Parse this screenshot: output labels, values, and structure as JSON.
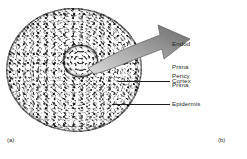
{
  "figure": {
    "panels": [
      {
        "id": "a",
        "caption": "(a)",
        "type": "light-micrograph",
        "subject": "root cross section",
        "callouts": [
          {
            "label": "Cortex",
            "line_y": 81,
            "line_x1": 118,
            "line_x2": 170,
            "text_x": 172,
            "text_y": 78
          },
          {
            "label": "Epidermis",
            "line_y": 104,
            "line_x1": 112,
            "line_x2": 170,
            "text_x": 172,
            "text_y": 101
          }
        ]
      },
      {
        "id": "b",
        "caption": "(b)",
        "type": "labeled-diagram",
        "labels": [
          {
            "text": "Endod",
            "x": 12,
            "y": 41
          },
          {
            "text": "Prima",
            "x": 12,
            "y": 64
          },
          {
            "text": "Pericy",
            "x": 12,
            "y": 73
          },
          {
            "text": "Prima",
            "x": 12,
            "y": 82
          }
        ]
      }
    ],
    "arrow": {
      "name": "magnification-arrow",
      "direction": "right",
      "fill_start": "#d8d8d8",
      "fill_end": "#6e6e6e",
      "stroke": "#5a5a5a"
    },
    "colors": {
      "background": "#ffffff",
      "text": "#262626",
      "leader_line": "#1a1a1a",
      "tissue_mid": "#b9b9b9",
      "stele": "#8d8d8d"
    }
  }
}
